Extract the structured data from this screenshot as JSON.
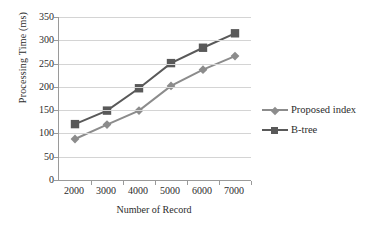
{
  "chart_data": {
    "type": "line",
    "title": "",
    "xlabel": "Number of Record",
    "ylabel": "Processing Time (ms)",
    "categories": [
      2000,
      3000,
      4000,
      5000,
      6000,
      7000
    ],
    "x_tick_labels": [
      "2000",
      "3000",
      "4000",
      "5000",
      "6000",
      "7000"
    ],
    "y_tick_labels": [
      "0",
      "50",
      "100",
      "150",
      "200",
      "250",
      "300",
      "350"
    ],
    "y_ticks": [
      0,
      50,
      100,
      150,
      200,
      250,
      300,
      350
    ],
    "ylim": [
      0,
      350
    ],
    "grid": "horizontal",
    "legend_position": "right",
    "series": [
      {
        "name": "Proposed index",
        "marker": "diamond",
        "color": "#8c8c8c",
        "values": [
          88,
          119,
          149,
          202,
          237,
          266
        ]
      },
      {
        "name": "B-tree",
        "marker": "square",
        "color": "#595959",
        "values": [
          120,
          149,
          197,
          251,
          284,
          315
        ]
      }
    ]
  },
  "colors": {
    "proposed_index": "#8c8c8c",
    "btree": "#595959",
    "gridline": "#d4d4d4",
    "axis": "#9a9a9a",
    "text": "#2b2b2b",
    "background": "#ffffff"
  }
}
